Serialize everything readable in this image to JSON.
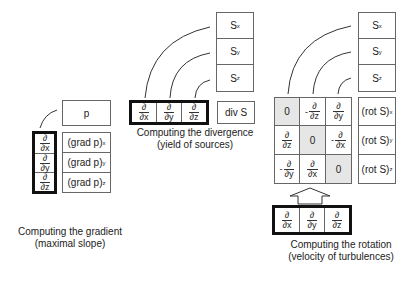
{
  "gradient": {
    "input": "p",
    "operator": [
      {
        "num": "∂",
        "den": "∂x"
      },
      {
        "num": "∂",
        "den": "∂y"
      },
      {
        "num": "∂",
        "den": "∂z"
      }
    ],
    "outputs": [
      {
        "base": "(grad p)",
        "sub": "x"
      },
      {
        "base": "(grad p)",
        "sub": "y"
      },
      {
        "base": "(grad p)",
        "sub": "z"
      }
    ],
    "caption_line1": "Computing the gradient",
    "caption_line2": "(maximal slope)"
  },
  "divergence": {
    "inputs": [
      {
        "base": "S",
        "sub": "x"
      },
      {
        "base": "S",
        "sub": "y"
      },
      {
        "base": "S",
        "sub": "z"
      }
    ],
    "operator": [
      {
        "num": "∂",
        "den": "∂x"
      },
      {
        "num": "∂",
        "den": "∂y"
      },
      {
        "num": "∂",
        "den": "∂z"
      }
    ],
    "output": "div S",
    "caption_line1": "Computing the divergence",
    "caption_line2": "(yield of sources)"
  },
  "rotation": {
    "inputs": [
      {
        "base": "S",
        "sub": "x"
      },
      {
        "base": "S",
        "sub": "y"
      },
      {
        "base": "S",
        "sub": "z"
      }
    ],
    "matrix": [
      [
        {
          "type": "zero",
          "text": "0"
        },
        {
          "type": "frac",
          "sign": "-",
          "num": "∂",
          "den": "∂z"
        },
        {
          "type": "frac",
          "sign": "",
          "num": "∂",
          "den": "∂y"
        }
      ],
      [
        {
          "type": "frac",
          "sign": "",
          "num": "∂",
          "den": "∂z"
        },
        {
          "type": "zero",
          "text": "0"
        },
        {
          "type": "frac",
          "sign": "-",
          "num": "∂",
          "den": "∂x"
        }
      ],
      [
        {
          "type": "frac",
          "sign": "-",
          "num": "∂",
          "den": "∂y"
        },
        {
          "type": "frac",
          "sign": "",
          "num": "∂",
          "den": "∂x"
        },
        {
          "type": "zero",
          "text": "0"
        }
      ]
    ],
    "outputs": [
      {
        "base": "(rot S)",
        "sub": "x"
      },
      {
        "base": "(rot S)",
        "sub": "y"
      },
      {
        "base": "(rot S)",
        "sub": "z"
      }
    ],
    "operator": [
      {
        "num": "∂",
        "den": "∂x"
      },
      {
        "num": "∂",
        "den": "∂y"
      },
      {
        "num": "∂",
        "den": "∂z"
      }
    ],
    "caption_line1": "Computing the rotation",
    "caption_line2": "(velocity of turbulences)"
  },
  "colors": {
    "diagonal_fill": "#e6e6e6",
    "thick_border": "#111111",
    "thin_border": "#666666"
  }
}
